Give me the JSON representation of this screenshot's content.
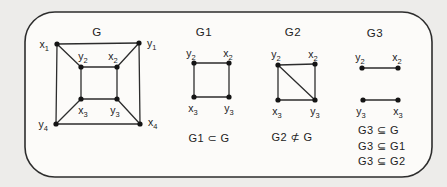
{
  "page": {
    "background": "#edecea",
    "frame_fill": "#fcfbf9",
    "line_color": "#2d2d2d",
    "node_color": "#141414",
    "text_color": "#222222"
  },
  "frame": {
    "x": 25,
    "y": 12,
    "w": 407,
    "h": 165,
    "rx": 30
  },
  "graphs": [
    {
      "id": "G",
      "title": "G",
      "title_x": 97,
      "title_y": 36,
      "nodes": [
        {
          "id": "x1",
          "base": "x",
          "sub": "1",
          "x": 57,
          "y": 44,
          "lx": 49,
          "ly": 48,
          "anchor": "end"
        },
        {
          "id": "y1",
          "base": "y",
          "sub": "1",
          "x": 139,
          "y": 43,
          "lx": 147,
          "ly": 47,
          "anchor": "start"
        },
        {
          "id": "y2",
          "base": "y",
          "sub": "2",
          "x": 81,
          "y": 67,
          "lx": 83,
          "ly": 60,
          "anchor": "middle"
        },
        {
          "id": "x2",
          "base": "x",
          "sub": "2",
          "x": 117,
          "y": 67,
          "lx": 113,
          "ly": 60,
          "anchor": "middle"
        },
        {
          "id": "x3",
          "base": "x",
          "sub": "3",
          "x": 81,
          "y": 99,
          "lx": 83,
          "ly": 114,
          "anchor": "middle"
        },
        {
          "id": "y3",
          "base": "y",
          "sub": "3",
          "x": 117,
          "y": 99,
          "lx": 115,
          "ly": 114,
          "anchor": "middle"
        },
        {
          "id": "y4",
          "base": "y",
          "sub": "4",
          "x": 56,
          "y": 124,
          "lx": 48,
          "ly": 128,
          "anchor": "end"
        },
        {
          "id": "x4",
          "base": "x",
          "sub": "4",
          "x": 140,
          "y": 124,
          "lx": 148,
          "ly": 126,
          "anchor": "start"
        }
      ],
      "edges": [
        [
          "x1",
          "y1"
        ],
        [
          "x1",
          "y4"
        ],
        [
          "y1",
          "x4"
        ],
        [
          "y4",
          "x4"
        ],
        [
          "y2",
          "x2"
        ],
        [
          "y2",
          "x3"
        ],
        [
          "x2",
          "y3"
        ],
        [
          "x3",
          "y3"
        ],
        [
          "x1",
          "y2"
        ],
        [
          "y1",
          "x2"
        ],
        [
          "y4",
          "x3"
        ],
        [
          "x4",
          "y3"
        ]
      ],
      "captions": []
    },
    {
      "id": "G1",
      "title": "G1",
      "title_x": 204,
      "title_y": 36,
      "nodes": [
        {
          "id": "y2",
          "base": "y",
          "sub": "2",
          "x": 194,
          "y": 63,
          "lx": 191,
          "ly": 57,
          "anchor": "middle"
        },
        {
          "id": "x2",
          "base": "x",
          "sub": "2",
          "x": 229,
          "y": 63,
          "lx": 228,
          "ly": 57,
          "anchor": "middle"
        },
        {
          "id": "x3",
          "base": "x",
          "sub": "3",
          "x": 194,
          "y": 97,
          "lx": 193,
          "ly": 112,
          "anchor": "middle"
        },
        {
          "id": "y3",
          "base": "y",
          "sub": "3",
          "x": 229,
          "y": 97,
          "lx": 229,
          "ly": 112,
          "anchor": "middle"
        }
      ],
      "edges": [
        [
          "y2",
          "x2"
        ],
        [
          "y2",
          "x3"
        ],
        [
          "x2",
          "y3"
        ],
        [
          "x3",
          "y3"
        ]
      ],
      "captions": [
        {
          "text": "G1 ⊂ G",
          "x": 209,
          "y": 142,
          "anchor": "middle"
        }
      ]
    },
    {
      "id": "G2",
      "title": "G2",
      "title_x": 293,
      "title_y": 36,
      "nodes": [
        {
          "id": "y2",
          "base": "y",
          "sub": "2",
          "x": 278,
          "y": 65,
          "lx": 276,
          "ly": 58,
          "anchor": "middle"
        },
        {
          "id": "x2",
          "base": "x",
          "sub": "2",
          "x": 315,
          "y": 64,
          "lx": 313,
          "ly": 58,
          "anchor": "middle"
        },
        {
          "id": "x3",
          "base": "x",
          "sub": "3",
          "x": 278,
          "y": 100,
          "lx": 277,
          "ly": 115,
          "anchor": "middle"
        },
        {
          "id": "y3",
          "base": "y",
          "sub": "3",
          "x": 315,
          "y": 100,
          "lx": 315,
          "ly": 115,
          "anchor": "middle"
        }
      ],
      "edges": [
        [
          "y2",
          "x2"
        ],
        [
          "y2",
          "x3"
        ],
        [
          "x2",
          "y3"
        ],
        [
          "x3",
          "y3"
        ],
        [
          "y2",
          "y3"
        ]
      ],
      "captions": [
        {
          "text": "G2 ⊄ G",
          "x": 292,
          "y": 141,
          "anchor": "middle"
        }
      ]
    },
    {
      "id": "G3",
      "title": "G3",
      "title_x": 375,
      "title_y": 37,
      "nodes": [
        {
          "id": "y2",
          "base": "y",
          "sub": "2",
          "x": 362,
          "y": 68,
          "lx": 360,
          "ly": 61,
          "anchor": "middle"
        },
        {
          "id": "x2",
          "base": "x",
          "sub": "2",
          "x": 398,
          "y": 68,
          "lx": 397,
          "ly": 61,
          "anchor": "middle"
        },
        {
          "id": "y3",
          "base": "y",
          "sub": "3",
          "x": 363,
          "y": 100,
          "lx": 361,
          "ly": 115,
          "anchor": "middle"
        },
        {
          "id": "x3",
          "base": "x",
          "sub": "3",
          "x": 398,
          "y": 100,
          "lx": 398,
          "ly": 115,
          "anchor": "middle"
        }
      ],
      "edges": [
        [
          "y2",
          "x2"
        ],
        [
          "y3",
          "x3"
        ]
      ],
      "captions": [
        {
          "text": "G3 ⊆ G",
          "x": 358,
          "y": 134,
          "anchor": "start"
        },
        {
          "text": "G3 ⊆ G1",
          "x": 358,
          "y": 150,
          "anchor": "start"
        },
        {
          "text": "G3 ⊆ G2",
          "x": 358,
          "y": 165,
          "anchor": "start"
        }
      ]
    }
  ]
}
